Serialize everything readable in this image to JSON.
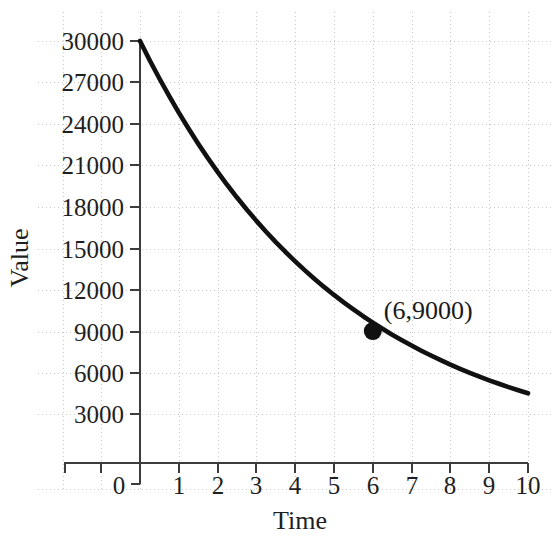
{
  "chart_data": {
    "type": "line",
    "title": "",
    "subtitle": "",
    "xlabel": "Time",
    "ylabel": "Value",
    "xlim": [
      0,
      10
    ],
    "ylim": [
      3000,
      30000
    ],
    "grid": true,
    "legend": null,
    "x_ticks": [
      "0",
      "1",
      "2",
      "3",
      "4",
      "5",
      "6",
      "7",
      "8",
      "9",
      "10"
    ],
    "x_tick_values": [
      0,
      1,
      2,
      3,
      4,
      5,
      6,
      7,
      8,
      9,
      10
    ],
    "y_ticks": [
      "3000",
      "6000",
      "9000",
      "12000",
      "15000",
      "18000",
      "21000",
      "24000",
      "27000",
      "30000"
    ],
    "y_tick_values": [
      3000,
      6000,
      9000,
      12000,
      15000,
      18000,
      21000,
      24000,
      27000,
      30000
    ],
    "series": [
      {
        "name": "Exponential decay",
        "color": "#111111",
        "x": [
          0,
          0.25,
          0.5,
          0.75,
          1,
          1.25,
          1.5,
          1.75,
          2,
          2.25,
          2.5,
          2.75,
          3,
          3.25,
          3.5,
          3.75,
          4,
          4.25,
          4.5,
          4.75,
          5,
          5.25,
          5.5,
          5.75,
          6,
          6.25,
          6.5,
          6.75,
          7,
          7.25,
          7.5,
          7.75,
          8,
          8.25,
          8.5,
          8.75,
          9,
          9.25,
          9.5,
          9.75,
          10
        ],
        "values": [
          30000,
          28610,
          27285,
          26021,
          24815,
          23665,
          22568,
          21522,
          20525,
          19574,
          18668,
          17803,
          16979,
          16193,
          15443,
          14728,
          14046,
          13395,
          12775,
          12183,
          11619,
          11081,
          10568,
          10078,
          9612,
          9167,
          8742,
          8337,
          7951,
          7583,
          7232,
          6897,
          6577,
          6272,
          5982,
          5705,
          5441,
          5189,
          4949,
          4719,
          4500
        ]
      }
    ],
    "annotated_points": [
      {
        "label": "(6,9000)",
        "x": 6,
        "y": 9000,
        "marker": "filled-circle",
        "marker_color": "#111111"
      }
    ]
  },
  "axis": {
    "y_title": "Value",
    "x_title": "Time"
  }
}
